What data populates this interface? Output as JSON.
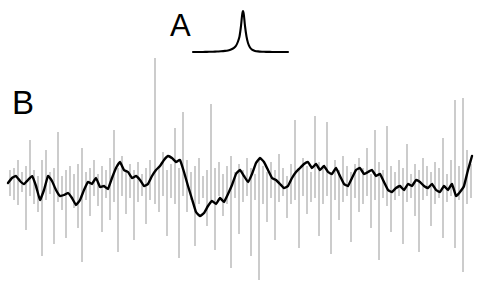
{
  "figure": {
    "width": 482,
    "height": 289,
    "background_color": "#ffffff",
    "trace_color": "#000000",
    "spike_color": "#999999"
  },
  "panels": {
    "a": {
      "label": "A",
      "label_x": 170,
      "label_y": 10,
      "description": "sharp narrow peak on flat baseline"
    },
    "b": {
      "label": "B",
      "label_x": 12,
      "label_y": 86,
      "description": "noisy signal trace with vertical error-bar spikes"
    }
  },
  "chart_data": [
    {
      "type": "line",
      "name": "panel-a-peak",
      "title": "A",
      "xlabel": "",
      "ylabel": "",
      "xlim": [
        193,
        288
      ],
      "ylim": [
        11,
        53
      ],
      "grid": false,
      "legend": "none",
      "baseline_y": 52,
      "peak_center_x": 243,
      "peak_apex_y": 11,
      "peak_half_width": 3.0,
      "lineshape": "lorentzian",
      "x": [
        193,
        197,
        201,
        205,
        209,
        213,
        217,
        221,
        225,
        228,
        231,
        234,
        236,
        238,
        239.5,
        241,
        242,
        242.6,
        243,
        243.4,
        244,
        245,
        246.5,
        248,
        250,
        252,
        255,
        258,
        262,
        266,
        270,
        274,
        278,
        282,
        285,
        288
      ],
      "y": [
        52,
        52,
        52,
        51.9,
        51.8,
        51.7,
        51.5,
        51.3,
        50.9,
        50.4,
        49.5,
        47.8,
        45.8,
        41.5,
        36.5,
        26.0,
        16.0,
        12.3,
        11.0,
        12.3,
        16.0,
        26.0,
        36.5,
        43.0,
        47.5,
        49.6,
        50.9,
        51.4,
        51.7,
        51.85,
        51.9,
        51.95,
        52,
        52,
        52,
        52
      ]
    },
    {
      "type": "line",
      "name": "panel-b-trace",
      "title": "B",
      "xlabel": "",
      "ylabel": "",
      "xlim": [
        8,
        472
      ],
      "ylim": [
        55,
        282
      ],
      "grid": false,
      "legend": "none",
      "mean_y": 180,
      "smooth_trace": {
        "x": [
          8,
          12,
          16,
          20,
          24,
          28,
          32,
          36,
          40,
          44,
          48,
          52,
          56,
          60,
          64,
          68,
          72,
          76,
          80,
          84,
          88,
          92,
          96,
          100,
          104,
          108,
          112,
          116,
          120,
          124,
          128,
          132,
          136,
          140,
          144,
          148,
          152,
          156,
          160,
          164,
          168,
          172,
          176,
          180,
          184,
          188,
          192,
          196,
          200,
          204,
          208,
          212,
          216,
          220,
          224,
          228,
          232,
          236,
          240,
          244,
          248,
          252,
          256,
          260,
          264,
          268,
          272,
          276,
          280,
          284,
          288,
          292,
          296,
          300,
          304,
          308,
          312,
          316,
          320,
          324,
          328,
          332,
          336,
          340,
          344,
          348,
          352,
          356,
          360,
          364,
          368,
          372,
          376,
          380,
          384,
          388,
          392,
          396,
          400,
          404,
          408,
          412,
          416,
          420,
          424,
          428,
          432,
          436,
          440,
          444,
          448,
          452,
          456,
          460,
          464,
          468,
          472
        ],
        "y": [
          183,
          178,
          176,
          181,
          184,
          180,
          176,
          186,
          200,
          190,
          176,
          181,
          190,
          196,
          195,
          193,
          198,
          205,
          200,
          190,
          182,
          184,
          178,
          187,
          186,
          189,
          178,
          168,
          162,
          170,
          172,
          178,
          176,
          180,
          186,
          184,
          176,
          170,
          166,
          160,
          156,
          158,
          162,
          160,
          172,
          186,
          199,
          212,
          216,
          213,
          206,
          201,
          204,
          198,
          202,
          194,
          185,
          174,
          170,
          176,
          182,
          174,
          163,
          158,
          162,
          170,
          178,
          180,
          184,
          188,
          186,
          178,
          172,
          168,
          164,
          162,
          168,
          164,
          170,
          166,
          172,
          174,
          168,
          176,
          184,
          186,
          178,
          170,
          168,
          174,
          172,
          170,
          176,
          174,
          182,
          190,
          192,
          188,
          186,
          190,
          184,
          186,
          180,
          182,
          186,
          188,
          184,
          190,
          192,
          186,
          190,
          184,
          196,
          192,
          186,
          170,
          156
        ]
      },
      "spikes": [
        {
          "x": 10,
          "y1": 170,
          "y2": 196
        },
        {
          "x": 14,
          "y1": 168,
          "y2": 200
        },
        {
          "x": 18,
          "y1": 160,
          "y2": 205
        },
        {
          "x": 22,
          "y1": 172,
          "y2": 192
        },
        {
          "x": 26,
          "y1": 166,
          "y2": 230
        },
        {
          "x": 30,
          "y1": 140,
          "y2": 196
        },
        {
          "x": 34,
          "y1": 170,
          "y2": 204
        },
        {
          "x": 38,
          "y1": 176,
          "y2": 212
        },
        {
          "x": 42,
          "y1": 160,
          "y2": 256
        },
        {
          "x": 46,
          "y1": 150,
          "y2": 200
        },
        {
          "x": 50,
          "y1": 172,
          "y2": 194
        },
        {
          "x": 54,
          "y1": 168,
          "y2": 244
        },
        {
          "x": 58,
          "y1": 132,
          "y2": 202
        },
        {
          "x": 62,
          "y1": 176,
          "y2": 210
        },
        {
          "x": 66,
          "y1": 170,
          "y2": 238
        },
        {
          "x": 70,
          "y1": 166,
          "y2": 196
        },
        {
          "x": 74,
          "y1": 174,
          "y2": 208
        },
        {
          "x": 78,
          "y1": 164,
          "y2": 228
        },
        {
          "x": 82,
          "y1": 148,
          "y2": 262
        },
        {
          "x": 86,
          "y1": 172,
          "y2": 200
        },
        {
          "x": 90,
          "y1": 168,
          "y2": 216
        },
        {
          "x": 94,
          "y1": 160,
          "y2": 196
        },
        {
          "x": 98,
          "y1": 174,
          "y2": 206
        },
        {
          "x": 102,
          "y1": 166,
          "y2": 232
        },
        {
          "x": 106,
          "y1": 170,
          "y2": 198
        },
        {
          "x": 110,
          "y1": 158,
          "y2": 220
        },
        {
          "x": 114,
          "y1": 130,
          "y2": 202
        },
        {
          "x": 118,
          "y1": 168,
          "y2": 252
        },
        {
          "x": 122,
          "y1": 156,
          "y2": 196
        },
        {
          "x": 126,
          "y1": 172,
          "y2": 214
        },
        {
          "x": 130,
          "y1": 164,
          "y2": 198
        },
        {
          "x": 134,
          "y1": 170,
          "y2": 240
        },
        {
          "x": 138,
          "y1": 162,
          "y2": 202
        },
        {
          "x": 142,
          "y1": 174,
          "y2": 196
        },
        {
          "x": 146,
          "y1": 168,
          "y2": 224
        },
        {
          "x": 150,
          "y1": 160,
          "y2": 200
        },
        {
          "x": 155,
          "y1": 58,
          "y2": 204
        },
        {
          "x": 159,
          "y1": 166,
          "y2": 212
        },
        {
          "x": 163,
          "y1": 152,
          "y2": 196
        },
        {
          "x": 167,
          "y1": 170,
          "y2": 236
        },
        {
          "x": 171,
          "y1": 164,
          "y2": 198
        },
        {
          "x": 175,
          "y1": 128,
          "y2": 204
        },
        {
          "x": 179,
          "y1": 168,
          "y2": 258
        },
        {
          "x": 183,
          "y1": 112,
          "y2": 196
        },
        {
          "x": 187,
          "y1": 160,
          "y2": 212
        },
        {
          "x": 191,
          "y1": 172,
          "y2": 200
        },
        {
          "x": 195,
          "y1": 166,
          "y2": 246
        },
        {
          "x": 199,
          "y1": 158,
          "y2": 204
        },
        {
          "x": 203,
          "y1": 176,
          "y2": 198
        },
        {
          "x": 207,
          "y1": 170,
          "y2": 226
        },
        {
          "x": 211,
          "y1": 104,
          "y2": 202
        },
        {
          "x": 215,
          "y1": 168,
          "y2": 250
        },
        {
          "x": 219,
          "y1": 162,
          "y2": 196
        },
        {
          "x": 223,
          "y1": 174,
          "y2": 216
        },
        {
          "x": 227,
          "y1": 166,
          "y2": 204
        },
        {
          "x": 231,
          "y1": 156,
          "y2": 268
        },
        {
          "x": 235,
          "y1": 172,
          "y2": 198
        },
        {
          "x": 239,
          "y1": 164,
          "y2": 234
        },
        {
          "x": 243,
          "y1": 170,
          "y2": 202
        },
        {
          "x": 247,
          "y1": 158,
          "y2": 196
        },
        {
          "x": 251,
          "y1": 168,
          "y2": 256
        },
        {
          "x": 255,
          "y1": 174,
          "y2": 200
        },
        {
          "x": 259,
          "y1": 160,
          "y2": 280
        },
        {
          "x": 263,
          "y1": 166,
          "y2": 204
        },
        {
          "x": 267,
          "y1": 172,
          "y2": 222
        },
        {
          "x": 271,
          "y1": 162,
          "y2": 198
        },
        {
          "x": 275,
          "y1": 170,
          "y2": 240
        },
        {
          "x": 279,
          "y1": 154,
          "y2": 202
        },
        {
          "x": 283,
          "y1": 168,
          "y2": 196
        },
        {
          "x": 287,
          "y1": 176,
          "y2": 218
        },
        {
          "x": 291,
          "y1": 164,
          "y2": 204
        },
        {
          "x": 295,
          "y1": 120,
          "y2": 200
        },
        {
          "x": 299,
          "y1": 170,
          "y2": 248
        },
        {
          "x": 303,
          "y1": 158,
          "y2": 196
        },
        {
          "x": 307,
          "y1": 166,
          "y2": 214
        },
        {
          "x": 311,
          "y1": 172,
          "y2": 202
        },
        {
          "x": 315,
          "y1": 116,
          "y2": 198
        },
        {
          "x": 319,
          "y1": 162,
          "y2": 236
        },
        {
          "x": 323,
          "y1": 168,
          "y2": 204
        },
        {
          "x": 327,
          "y1": 122,
          "y2": 196
        },
        {
          "x": 331,
          "y1": 174,
          "y2": 254
        },
        {
          "x": 335,
          "y1": 160,
          "y2": 200
        },
        {
          "x": 339,
          "y1": 170,
          "y2": 220
        },
        {
          "x": 343,
          "y1": 156,
          "y2": 202
        },
        {
          "x": 347,
          "y1": 166,
          "y2": 196
        },
        {
          "x": 351,
          "y1": 172,
          "y2": 242
        },
        {
          "x": 355,
          "y1": 164,
          "y2": 198
        },
        {
          "x": 359,
          "y1": 158,
          "y2": 212
        },
        {
          "x": 363,
          "y1": 168,
          "y2": 204
        },
        {
          "x": 367,
          "y1": 148,
          "y2": 196
        },
        {
          "x": 371,
          "y1": 174,
          "y2": 228
        },
        {
          "x": 375,
          "y1": 130,
          "y2": 200
        },
        {
          "x": 379,
          "y1": 162,
          "y2": 260
        },
        {
          "x": 383,
          "y1": 170,
          "y2": 198
        },
        {
          "x": 387,
          "y1": 126,
          "y2": 206
        },
        {
          "x": 391,
          "y1": 166,
          "y2": 232
        },
        {
          "x": 395,
          "y1": 172,
          "y2": 200
        },
        {
          "x": 399,
          "y1": 160,
          "y2": 196
        },
        {
          "x": 403,
          "y1": 168,
          "y2": 244
        },
        {
          "x": 407,
          "y1": 144,
          "y2": 202
        },
        {
          "x": 411,
          "y1": 174,
          "y2": 198
        },
        {
          "x": 415,
          "y1": 164,
          "y2": 216
        },
        {
          "x": 419,
          "y1": 170,
          "y2": 252
        },
        {
          "x": 423,
          "y1": 158,
          "y2": 200
        },
        {
          "x": 427,
          "y1": 166,
          "y2": 196
        },
        {
          "x": 431,
          "y1": 172,
          "y2": 226
        },
        {
          "x": 435,
          "y1": 162,
          "y2": 204
        },
        {
          "x": 439,
          "y1": 168,
          "y2": 198
        },
        {
          "x": 443,
          "y1": 138,
          "y2": 238
        },
        {
          "x": 447,
          "y1": 174,
          "y2": 202
        },
        {
          "x": 451,
          "y1": 160,
          "y2": 196
        },
        {
          "x": 455,
          "y1": 100,
          "y2": 248
        },
        {
          "x": 459,
          "y1": 166,
          "y2": 200
        },
        {
          "x": 463,
          "y1": 98,
          "y2": 272
        },
        {
          "x": 467,
          "y1": 150,
          "y2": 204
        },
        {
          "x": 471,
          "y1": 164,
          "y2": 198
        }
      ]
    }
  ]
}
